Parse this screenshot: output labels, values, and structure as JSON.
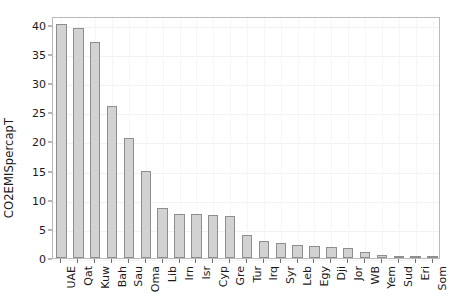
{
  "chart_data": {
    "type": "bar",
    "title": "",
    "xlabel": "",
    "ylabel": "CO2EMISpercapT",
    "ylim": [
      0,
      41.5
    ],
    "yticks": [
      0,
      5,
      10,
      15,
      20,
      25,
      30,
      35,
      40
    ],
    "grid": true,
    "legend": null,
    "categories": [
      "UAE",
      "Qat",
      "Kuw",
      "Bah",
      "Sau",
      "Oma",
      "Lib",
      "Irn",
      "Isr",
      "Cyp",
      "Gre",
      "Tur",
      "Irq",
      "Syr",
      "Leb",
      "Egy",
      "Dji",
      "Jor",
      "WB",
      "Yem",
      "Sud",
      "Eri",
      "Som"
    ],
    "values": [
      40.2,
      39.5,
      37.0,
      26.1,
      20.6,
      15.0,
      8.5,
      7.6,
      7.5,
      7.3,
      7.2,
      4.0,
      3.0,
      2.5,
      2.2,
      2.0,
      1.9,
      1.7,
      1.0,
      0.6,
      0.4,
      0.2,
      0.1
    ],
    "bar_fill": "#d2d2d2",
    "bar_stroke": "#8e8e8e",
    "axis_color": "#b9b9b9",
    "grid_color": "#f2f2f2",
    "text_color": "#1a1a1a"
  },
  "axis": {
    "y_title": "CO2EMISpercapT"
  }
}
